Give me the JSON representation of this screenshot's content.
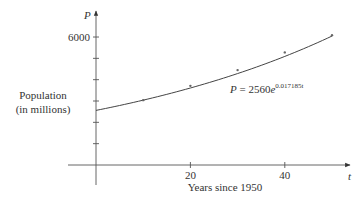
{
  "chart_data": {
    "type": "scatter",
    "title": "",
    "xlabel": "Years since 1950",
    "ylabel": "Population (in millions)",
    "ylabel_lines": [
      "Population",
      "(in millions)"
    ],
    "x_axis_symbol": "t",
    "y_axis_symbol": "P",
    "x_ticks": [
      {
        "value": 10,
        "label": ""
      },
      {
        "value": 20,
        "label": "20"
      },
      {
        "value": 30,
        "label": ""
      },
      {
        "value": 40,
        "label": "40"
      }
    ],
    "y_ticks": [
      {
        "value": 1000,
        "label": ""
      },
      {
        "value": 2000,
        "label": ""
      },
      {
        "value": 3000,
        "label": ""
      },
      {
        "value": 4000,
        "label": ""
      },
      {
        "value": 5000,
        "label": ""
      },
      {
        "value": 6000,
        "label": "6000"
      }
    ],
    "xlim": [
      0,
      50
    ],
    "ylim": [
      0,
      6000
    ],
    "grid": false,
    "series": [
      {
        "name": "Observed population",
        "x": [
          10,
          20,
          30,
          40,
          50
        ],
        "values": [
          3040,
          3710,
          4450,
          5280,
          6080
        ]
      },
      {
        "name": "Exponential model",
        "type": "line",
        "equation": "P = 2560e^(0.017185t)",
        "a": 2560,
        "k": 0.017185
      }
    ],
    "annotation": {
      "lhs": "P = 2560",
      "base": "e",
      "exponent": "0.017185t"
    }
  }
}
